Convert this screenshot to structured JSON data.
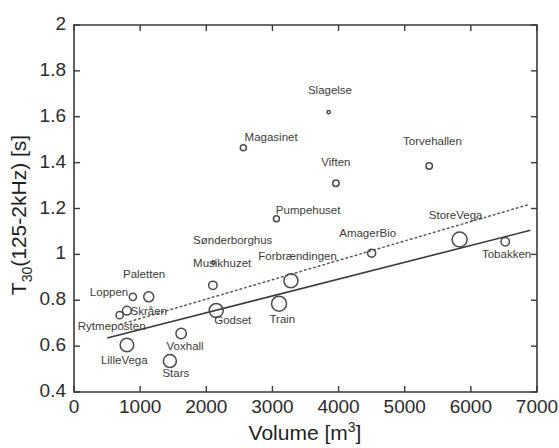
{
  "chart_data": {
    "type": "scatter",
    "title": "",
    "xlabel": "Volume [m3]",
    "xlabel_base": "Volume [m",
    "xlabel_sup": "3",
    "xlabel_tail": "]",
    "ylabel_base": "T",
    "ylabel_sub": "30",
    "ylabel_rest": "(125-2kHz) [s]",
    "ylabel": "T30(125-2kHz) [s]",
    "xlim": [
      0,
      7000
    ],
    "ylim": [
      0.4,
      2.0
    ],
    "xticks": [
      0,
      1000,
      2000,
      3000,
      4000,
      5000,
      6000,
      7000
    ],
    "xticklabels": [
      "0",
      "1000",
      "2000",
      "3000",
      "4000",
      "5000",
      "6000",
      "7000"
    ],
    "yticks": [
      0.4,
      0.6,
      0.8,
      1.0,
      1.2,
      1.4,
      1.6,
      1.8,
      2.0
    ],
    "yticklabels": [
      "0.4",
      "0.6",
      "0.8",
      "1",
      "1.2",
      "1.4",
      "1.6",
      "1.8",
      "2"
    ],
    "grid": false,
    "legend": "none",
    "marker_shape": "circle-open",
    "point_color": "#4a4a4a",
    "line_color": "#3a3a3a",
    "points": [
      {
        "label": "Slagelse",
        "x": 3850,
        "y": 1.62,
        "r": 1.6,
        "lx": 3870,
        "ly": 1.7
      },
      {
        "label": "Magasinet",
        "x": 2560,
        "y": 1.465,
        "r": 3.0,
        "lx": 2980,
        "ly": 1.495
      },
      {
        "label": "Torvehallen",
        "x": 5370,
        "y": 1.385,
        "r": 3.2,
        "lx": 5420,
        "ly": 1.475
      },
      {
        "label": "Viften",
        "x": 3960,
        "y": 1.31,
        "r": 3.2,
        "lx": 3960,
        "ly": 1.385
      },
      {
        "label": "Pumpehuset",
        "x": 3060,
        "y": 1.155,
        "r": 3.0,
        "lx": 3540,
        "ly": 1.175
      },
      {
        "label": "StoreVega",
        "x": 5830,
        "y": 1.065,
        "r": 7.5,
        "lx": 5770,
        "ly": 1.155
      },
      {
        "label": "Tobakken",
        "x": 6520,
        "y": 1.055,
        "r": 4.2,
        "lx": 6540,
        "ly": 0.985
      },
      {
        "label": "Sønderborghus",
        "x": 2110,
        "y": 0.965,
        "r": 1.6,
        "lx": 2400,
        "ly": 1.045
      },
      {
        "label": "AmagerBio",
        "x": 4500,
        "y": 1.005,
        "r": 4.0,
        "lx": 4440,
        "ly": 1.075
      },
      {
        "label": "Forbrændingen",
        "x": 3280,
        "y": 0.885,
        "r": 7.0,
        "lx": 3380,
        "ly": 0.975
      },
      {
        "label": "Musikhuzet",
        "x": 2100,
        "y": 0.865,
        "r": 4.2,
        "lx": 2240,
        "ly": 0.945
      },
      {
        "label": "Paletten",
        "x": 1130,
        "y": 0.815,
        "r": 5.0,
        "lx": 1060,
        "ly": 0.895
      },
      {
        "label": "Loppen",
        "x": 890,
        "y": 0.815,
        "r": 3.6,
        "lx": 530,
        "ly": 0.818
      },
      {
        "label": "Train",
        "x": 3100,
        "y": 0.785,
        "r": 7.5,
        "lx": 3150,
        "ly": 0.7
      },
      {
        "label": "Godset",
        "x": 2150,
        "y": 0.755,
        "r": 7.0,
        "lx": 2400,
        "ly": 0.695
      },
      {
        "label": "Skråen",
        "x": 800,
        "y": 0.755,
        "r": 4.4,
        "lx": 1130,
        "ly": 0.735
      },
      {
        "label": "Rytmeposten",
        "x": 690,
        "y": 0.735,
        "r": 3.6,
        "lx": 570,
        "ly": 0.672
      },
      {
        "label": "Voxhall",
        "x": 1620,
        "y": 0.655,
        "r": 5.2,
        "lx": 1680,
        "ly": 0.585
      },
      {
        "label": "LilleVega",
        "x": 800,
        "y": 0.605,
        "r": 6.8,
        "lx": 760,
        "ly": 0.523
      },
      {
        "label": "Stars",
        "x": 1450,
        "y": 0.535,
        "r": 6.5,
        "lx": 1540,
        "ly": 0.465
      }
    ],
    "fit_line": {
      "name": "regression",
      "x": [
        500,
        6900
      ],
      "y": [
        0.635,
        1.105
      ],
      "style": "solid"
    },
    "dotted_line": {
      "name": "reference",
      "x": [
        700,
        6850
      ],
      "y": [
        0.695,
        1.215
      ],
      "style": "dotted"
    }
  }
}
